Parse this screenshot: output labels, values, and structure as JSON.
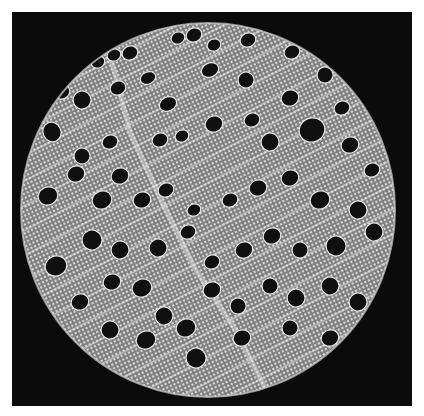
{
  "image": {
    "subject": "micrograph-cross-section",
    "background_color": "#0b0b0b",
    "disc": {
      "cx": 208,
      "cy": 210,
      "r": 187,
      "fill": "#8a8a8a",
      "texture_color": "#d8d8d8"
    },
    "pores": [
      [
        98,
        62,
        7,
        6
      ],
      [
        114,
        55,
        7,
        6
      ],
      [
        130,
        53,
        8,
        7
      ],
      [
        178,
        38,
        7,
        6
      ],
      [
        194,
        35,
        8,
        7
      ],
      [
        214,
        45,
        7,
        6
      ],
      [
        248,
        40,
        8,
        7
      ],
      [
        292,
        52,
        8,
        7
      ],
      [
        325,
        75,
        8,
        8
      ],
      [
        62,
        92,
        8,
        7
      ],
      [
        82,
        100,
        9,
        9
      ],
      [
        118,
        88,
        8,
        7
      ],
      [
        148,
        78,
        8,
        6
      ],
      [
        168,
        104,
        9,
        7
      ],
      [
        210,
        70,
        9,
        7
      ],
      [
        246,
        80,
        8,
        8
      ],
      [
        290,
        98,
        9,
        8
      ],
      [
        342,
        108,
        8,
        7
      ],
      [
        52,
        132,
        9,
        10
      ],
      [
        82,
        156,
        8,
        8
      ],
      [
        110,
        142,
        8,
        7
      ],
      [
        120,
        176,
        9,
        8
      ],
      [
        160,
        140,
        8,
        7
      ],
      [
        182,
        136,
        7,
        6
      ],
      [
        214,
        124,
        9,
        8
      ],
      [
        252,
        120,
        8,
        7
      ],
      [
        270,
        142,
        9,
        9
      ],
      [
        312,
        130,
        13,
        12
      ],
      [
        350,
        145,
        9,
        8
      ],
      [
        372,
        170,
        8,
        7
      ],
      [
        48,
        196,
        10,
        9
      ],
      [
        76,
        174,
        9,
        8
      ],
      [
        102,
        200,
        10,
        9
      ],
      [
        142,
        200,
        9,
        8
      ],
      [
        166,
        190,
        8,
        7
      ],
      [
        194,
        210,
        7,
        6
      ],
      [
        230,
        200,
        8,
        7
      ],
      [
        258,
        188,
        9,
        8
      ],
      [
        290,
        178,
        9,
        8
      ],
      [
        320,
        200,
        10,
        9
      ],
      [
        358,
        210,
        9,
        9
      ],
      [
        56,
        266,
        11,
        10
      ],
      [
        92,
        240,
        10,
        10
      ],
      [
        120,
        250,
        9,
        9
      ],
      [
        158,
        248,
        9,
        9
      ],
      [
        188,
        232,
        8,
        7
      ],
      [
        212,
        262,
        8,
        7
      ],
      [
        244,
        250,
        9,
        8
      ],
      [
        272,
        236,
        9,
        8
      ],
      [
        300,
        250,
        8,
        8
      ],
      [
        336,
        246,
        10,
        10
      ],
      [
        374,
        232,
        9,
        9
      ],
      [
        80,
        302,
        9,
        8
      ],
      [
        112,
        282,
        9,
        8
      ],
      [
        142,
        288,
        10,
        9
      ],
      [
        164,
        316,
        9,
        9
      ],
      [
        186,
        328,
        10,
        9
      ],
      [
        212,
        290,
        9,
        8
      ],
      [
        238,
        306,
        8,
        8
      ],
      [
        270,
        286,
        8,
        8
      ],
      [
        296,
        298,
        9,
        9
      ],
      [
        330,
        286,
        9,
        9
      ],
      [
        358,
        302,
        9,
        9
      ],
      [
        110,
        330,
        9,
        9
      ],
      [
        146,
        340,
        10,
        9
      ],
      [
        196,
        358,
        10,
        10
      ],
      [
        242,
        338,
        9,
        8
      ],
      [
        290,
        328,
        8,
        8
      ],
      [
        330,
        338,
        9,
        8
      ]
    ]
  }
}
